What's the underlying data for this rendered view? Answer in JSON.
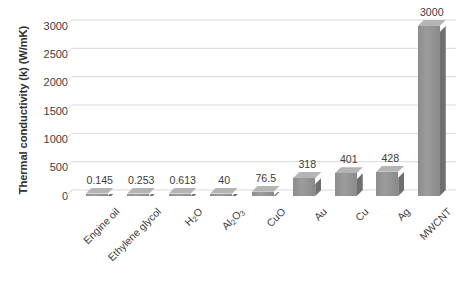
{
  "chart_data": {
    "type": "bar",
    "title": "",
    "xlabel": "",
    "ylabel": "Thermal conductivity (k) (W/mK)",
    "ylim": [
      0,
      3000
    ],
    "ytick_labels": [
      "3000",
      "2500",
      "2000",
      "1500",
      "1000",
      "500",
      "0"
    ],
    "ytick_values": [
      3000,
      2500,
      2000,
      1500,
      1000,
      500,
      0
    ],
    "grid": true,
    "legend": "none",
    "style": "3d-column",
    "bar_color": "#8f8f8f",
    "bar_top_color": "#b4b4b4",
    "bar_side_color": "#6f6f6f",
    "gridline_color": "#d9d9d9",
    "categories": [
      "Engine oil",
      "Ethylene glycol",
      "H2O",
      "Al2O3",
      "CuO",
      "Au",
      "Cu",
      "Ag",
      "MWCNT"
    ],
    "values": [
      0.145,
      0.253,
      0.613,
      40,
      76.5,
      318,
      401,
      428,
      3000
    ],
    "data_labels": [
      "0.145",
      "0.253",
      "0.613",
      "40",
      "76.5",
      "318",
      "401",
      "428",
      "3000"
    ],
    "category_labels_html": [
      "Engine oil",
      "Ethylene glycol",
      "H<sub>2</sub>O",
      "Al<sub>2</sub>O<sub>3</sub>",
      "CuO",
      "Au",
      "Cu",
      "Ag",
      "MWCNT"
    ]
  }
}
